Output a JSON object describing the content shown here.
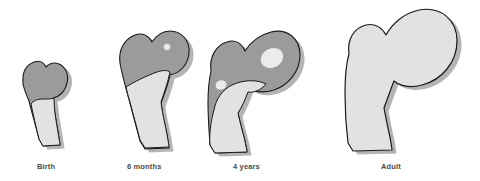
{
  "figure": {
    "background_color": "#ffffff",
    "width": 480,
    "height": 181
  },
  "palette": {
    "cartilage": "#9b9b9b",
    "bone": "#e2e2e2",
    "ossification_center": "#ebebeb",
    "outline": "#1a1a1a",
    "shadow": "#b4b4b4",
    "caption_text": "#4a4a4a"
  },
  "legend_meaning": {
    "dark_gray": "cartilage",
    "light_gray": "ossified bone",
    "light_oval": "secondary ossification center"
  },
  "stages": [
    {
      "id": "birth",
      "label": "Birth",
      "order": 1,
      "cartilage_visible": true,
      "bone_visible": true,
      "ossification_centers": 0,
      "relative_size": "smallest"
    },
    {
      "id": "six-months",
      "label": "6 months",
      "order": 2,
      "cartilage_visible": true,
      "bone_visible": true,
      "ossification_centers": 1,
      "relative_size": "small"
    },
    {
      "id": "four-years",
      "label": "4 years",
      "order": 3,
      "cartilage_visible": true,
      "bone_visible": true,
      "ossification_centers": 2,
      "relative_size": "medium"
    },
    {
      "id": "adult",
      "label": "Adult",
      "order": 4,
      "cartilage_visible": false,
      "bone_visible": true,
      "ossification_centers": 0,
      "relative_size": "largest"
    }
  ]
}
